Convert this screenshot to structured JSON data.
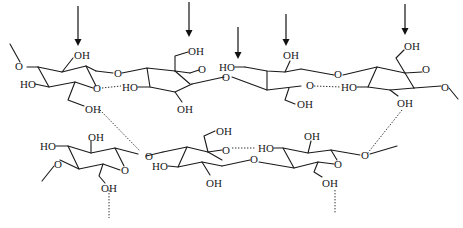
{
  "figure": {
    "arrows": [
      {
        "x": 78,
        "y1": 6,
        "y2": 45
      },
      {
        "x": 189,
        "y1": 2,
        "y2": 36
      },
      {
        "x": 238,
        "y1": 27,
        "y2": 58
      },
      {
        "x": 286,
        "y1": 14,
        "y2": 45
      },
      {
        "x": 405,
        "y1": 4,
        "y2": 34
      }
    ],
    "labels": {
      "top_ring1_oh": "OH",
      "top_ring1_ho": "HO",
      "top_ring1_ring_o": "O",
      "top_ring1_ch2oh": "OH",
      "top_ring1_left_o": "O",
      "top_glyco_o1": "O",
      "top_ring2_oh_top": "OH",
      "top_ring2_ring_o": "O",
      "top_ring2_ho": "HO",
      "top_ring2_oh_bottom": "OH",
      "top_glyco_o2": "O",
      "top_ring3_ho": "HO",
      "top_ring3_oh": "OH",
      "top_ring3_ring_o": "O",
      "top_ring3_ch2oh": "OH",
      "top_glyco_o3": "O",
      "top_ring4_oh_top": "OH",
      "top_ring4_ring_o": "O",
      "top_ring4_ho": "HO",
      "top_ring4_oh_bottom": "OH",
      "top_right_o": "O",
      "bot_ring1_ho": "HO",
      "bot_ring1_oh": "OH",
      "bot_ring1_left_o": "O",
      "bot_ring1_ring_o": "O",
      "bot_ring1_ch2oh": "OH",
      "bot_glyco_o1": "O",
      "bot_ring2_oh_top": "OH",
      "bot_ring2_ring_o": "O",
      "bot_ring2_ho": "HO",
      "bot_ring2_oh_bottom": "OH",
      "bot_glyco_o2": "O",
      "bot_ring3_ho": "HO",
      "bot_ring3_oh": "OH",
      "bot_ring3_ring_o": "O",
      "bot_ring3_ch2oh": "OH",
      "bot_right_o": "O"
    }
  }
}
